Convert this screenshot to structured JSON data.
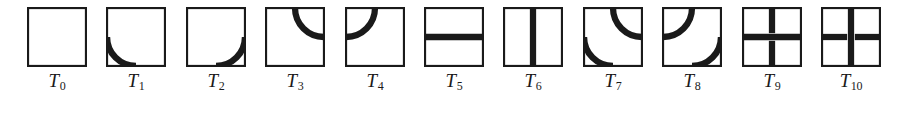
{
  "figure": {
    "name": "wang-tile-set",
    "background_color": "#ffffff",
    "ink_color": "#1a1a1a",
    "tile_count": 11,
    "tile_size_px": 60,
    "border_stroke_px": 2.2,
    "mark_stroke_px": 6.5
  },
  "tiles": [
    {
      "id": "T0",
      "label_base": "T",
      "label_sub": "0",
      "marks": [],
      "description": "empty square"
    },
    {
      "id": "T1",
      "label_base": "T",
      "label_sub": "1",
      "marks": [
        "arc-left-bottom"
      ],
      "description": "quarter arc joining left edge midpoint to bottom edge midpoint"
    },
    {
      "id": "T2",
      "label_base": "T",
      "label_sub": "2",
      "marks": [
        "arc-bottom-right"
      ],
      "description": "quarter arc joining bottom edge midpoint to right edge midpoint"
    },
    {
      "id": "T3",
      "label_base": "T",
      "label_sub": "3",
      "marks": [
        "arc-top-right"
      ],
      "description": "quarter arc joining top edge midpoint to right edge midpoint"
    },
    {
      "id": "T4",
      "label_base": "T",
      "label_sub": "4",
      "marks": [
        "arc-top-left"
      ],
      "description": "quarter arc joining top edge midpoint to left edge midpoint"
    },
    {
      "id": "T5",
      "label_base": "T",
      "label_sub": "5",
      "marks": [
        "bar-horizontal"
      ],
      "description": "full horizontal bar across the middle"
    },
    {
      "id": "T6",
      "label_base": "T",
      "label_sub": "6",
      "marks": [
        "bar-vertical"
      ],
      "description": "full vertical bar down the middle"
    },
    {
      "id": "T7",
      "label_base": "T",
      "label_sub": "7",
      "marks": [
        "arc-top-right",
        "arc-left-bottom"
      ],
      "description": "two opposite quarter arcs: top-right and bottom-left"
    },
    {
      "id": "T8",
      "label_base": "T",
      "label_sub": "8",
      "marks": [
        "arc-top-left",
        "arc-bottom-right"
      ],
      "description": "two opposite quarter arcs: top-left and bottom-right"
    },
    {
      "id": "T9",
      "label_base": "T",
      "label_sub": "9",
      "marks": [
        "bar-horizontal",
        "stub-top",
        "stub-bottom"
      ],
      "description": "full horizontal bar with vertical stubs from top and bottom edges stopping short of the bar"
    },
    {
      "id": "T10",
      "label_base": "T",
      "label_sub": "10",
      "marks": [
        "bar-vertical",
        "stub-left",
        "stub-right"
      ],
      "description": "full vertical bar with horizontal stubs from left and right edges stopping short of the bar"
    }
  ]
}
